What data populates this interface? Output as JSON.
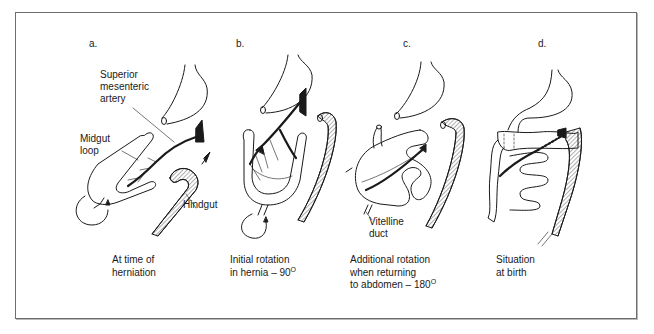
{
  "figure": {
    "panels": [
      {
        "letter": "a.",
        "caption_lines": [
          "At time of",
          "herniation"
        ],
        "labels": {
          "artery_lines": [
            "Superior",
            "mesenteric",
            "artery"
          ],
          "midgut_lines": [
            "Midgut",
            "loop"
          ],
          "hindgut": "Hindgut"
        }
      },
      {
        "letter": "b.",
        "caption_lines": [
          "Initial rotation",
          "in hernia – 90"
        ],
        "caption_degree": "O"
      },
      {
        "letter": "c.",
        "caption_lines": [
          "Additional rotation",
          "when returning",
          "to abdomen – 180"
        ],
        "caption_degree": "O",
        "labels": {
          "vitelline_lines": [
            "Vitelline",
            "duct"
          ]
        }
      },
      {
        "letter": "d.",
        "caption_lines": [
          "Situation",
          "at birth"
        ]
      }
    ]
  },
  "colors": {
    "frame_border": "#6e6e6e",
    "ink": "#1a1a1a",
    "background": "#ffffff"
  }
}
